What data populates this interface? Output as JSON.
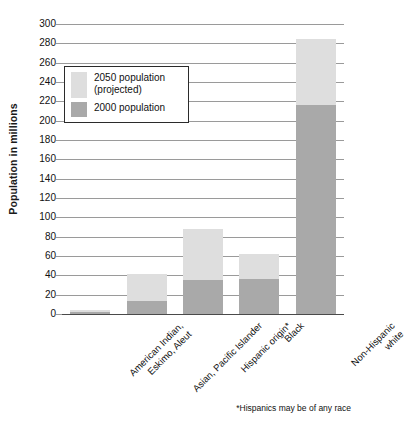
{
  "chart_data": {
    "type": "bar",
    "stacked": true,
    "title": "",
    "xlabel": "",
    "ylabel": "Population in millions",
    "ylim": [
      0,
      300
    ],
    "ytick_step": 20,
    "yticks": [
      300,
      280,
      260,
      240,
      220,
      200,
      180,
      160,
      140,
      120,
      100,
      80,
      60,
      40,
      20,
      0
    ],
    "grid": true,
    "legend_position": "upper-left-inside",
    "categories": [
      "American Indian, Eskimo, Aleut",
      "Asian, Pacific Islander",
      "Hispanic origin*",
      "Black",
      "Non-Hispanic white"
    ],
    "category_lines": [
      [
        "American Indian,",
        "Eskimo, Aleut"
      ],
      [
        "Asian, Pacific Islander",
        ""
      ],
      [
        "Hispanic origin*",
        ""
      ],
      [
        "Black",
        ""
      ],
      [
        "Non-Hispanic",
        "white"
      ]
    ],
    "series": [
      {
        "name": "2000 population",
        "color": "#a9a9a9",
        "values": [
          2,
          13,
          35,
          36,
          216
        ]
      },
      {
        "name": "2050 population (projected)",
        "color": "#dedede",
        "values": [
          4,
          41,
          88,
          62,
          285
        ]
      }
    ],
    "annotations": [
      "*Hispanics may be of any race"
    ]
  },
  "legend": {
    "items": [
      {
        "label_line1": "2050 population",
        "label_line2": "(projected)",
        "color": "#dedede"
      },
      {
        "label_line1": "2000 population",
        "label_line2": "",
        "color": "#a9a9a9"
      }
    ]
  },
  "footnote": "*Hispanics may be of any race",
  "colors": {
    "projected": "#dedede",
    "base": "#a9a9a9",
    "gridline": "#9a9a9a",
    "axis": "#4a4a4a",
    "text": "#111111",
    "legend_border": "#2b2b2b"
  }
}
